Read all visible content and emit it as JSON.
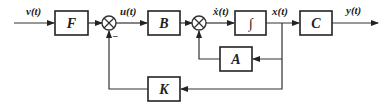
{
  "diagram": {
    "type": "state-feedback block diagram",
    "blocks": [
      {
        "id": "F",
        "label": "F"
      },
      {
        "id": "B",
        "label": "B"
      },
      {
        "id": "integrator",
        "label": "∫"
      },
      {
        "id": "C",
        "label": "C"
      },
      {
        "id": "A",
        "label": "A"
      },
      {
        "id": "K",
        "label": "K"
      }
    ],
    "signals": {
      "input": "v(t)",
      "control": "u(t)",
      "state_derivative": "ẋ(t)",
      "state": "x(t)",
      "output": "y(t)"
    },
    "summing_junctions": [
      {
        "id": "sum1",
        "feedback_sign": "−"
      },
      {
        "id": "sum2",
        "feedback_sign": ""
      }
    ]
  }
}
